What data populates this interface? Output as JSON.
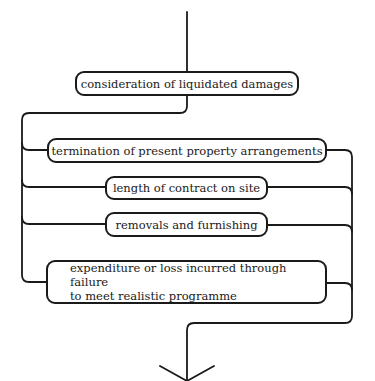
{
  "diagram": {
    "colors": {
      "line": "#1a1a1a",
      "background": "#ffffff"
    },
    "nodes": [
      {
        "id": "liquidated",
        "label": "consideration of liquidated damages"
      },
      {
        "id": "termination",
        "label": "termination of present property arrangements"
      },
      {
        "id": "length",
        "label": "length of contract on site"
      },
      {
        "id": "removals",
        "label": "removals and furnishing"
      },
      {
        "id": "expenditure",
        "label_line1": "expenditure or loss incurred through failure",
        "label_line2": "to meet realistic programme"
      }
    ],
    "flow": {
      "entry": "top arrow into liquidated",
      "split": "liquidated fans out to termination, length, removals, expenditure",
      "merge": "all four converge to single downward arrow",
      "exit_icon": "arrow-down-icon"
    }
  }
}
